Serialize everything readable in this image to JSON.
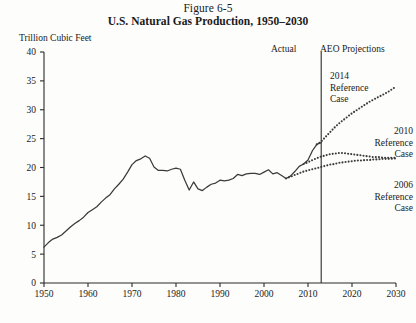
{
  "figure": {
    "number": "Figure 6-5",
    "title": "U.S. Natural Gas Production, 1950–2030",
    "unit_label": "Trillion Cubic Feet",
    "source": "Source: Energy Information Administration, Annual Energy Outlook (AEO) 2006, 2010, and 2014.",
    "period_actual_label": "Actual",
    "period_projection_label": "AEO Projections",
    "annotation_2014": "2014\nReference\nCase",
    "annotation_2014_line1": "2014",
    "annotation_2014_line2": "Reference",
    "annotation_2014_line3": "Case",
    "annotation_2010_line1": "2010",
    "annotation_2010_line2": "Reference",
    "annotation_2010_line3": "Case",
    "annotation_2006_line1": "2006",
    "annotation_2006_line2": "Reference",
    "annotation_2006_line3": "Case"
  },
  "colors": {
    "background": "#fdfdfb",
    "ink": "#1a1a1a",
    "line": "#3a3a3a",
    "axis": "#2b2b2b"
  },
  "chart_data": {
    "type": "line",
    "title": "U.S. Natural Gas Production, 1950–2030",
    "subtitle": "Figure 6-5",
    "xlabel": "",
    "ylabel": "Trillion Cubic Feet",
    "xlim": [
      1950,
      2030
    ],
    "ylim": [
      0,
      40
    ],
    "ytick_values": [
      0,
      5,
      10,
      15,
      20,
      25,
      30,
      35,
      40
    ],
    "ytick_labels": [
      "0",
      "5",
      "10",
      "15",
      "20",
      "25",
      "30",
      "35",
      "40"
    ],
    "xtick_values": [
      1950,
      1960,
      1970,
      1980,
      1990,
      2000,
      2010,
      2020,
      2030
    ],
    "xtick_labels": [
      "1950",
      "1960",
      "1970",
      "1980",
      "1990",
      "2000",
      "2010",
      "2020",
      "2030"
    ],
    "grid": false,
    "legend": "annotations-inline",
    "divider_x": 2013,
    "divider_label_left": "Actual",
    "divider_label_right": "AEO Projections",
    "series": [
      {
        "name": "Actual",
        "style": "solid",
        "x": [
          1950,
          1951,
          1952,
          1953,
          1954,
          1955,
          1956,
          1957,
          1958,
          1959,
          1960,
          1961,
          1962,
          1963,
          1964,
          1965,
          1966,
          1967,
          1968,
          1969,
          1970,
          1971,
          1972,
          1973,
          1974,
          1975,
          1976,
          1977,
          1978,
          1979,
          1980,
          1981,
          1982,
          1983,
          1984,
          1985,
          1986,
          1987,
          1988,
          1989,
          1990,
          1991,
          1992,
          1993,
          1994,
          1995,
          1996,
          1997,
          1998,
          1999,
          2000,
          2001,
          2002,
          2003,
          2004,
          2005,
          2006,
          2007,
          2008,
          2009,
          2010,
          2011,
          2012,
          2013
        ],
        "y": [
          6.2,
          7.0,
          7.6,
          7.9,
          8.3,
          9.0,
          9.7,
          10.3,
          10.8,
          11.4,
          12.2,
          12.7,
          13.2,
          14.0,
          14.7,
          15.3,
          16.3,
          17.1,
          18.0,
          19.2,
          20.5,
          21.2,
          21.5,
          22.0,
          21.6,
          20.1,
          19.5,
          19.5,
          19.4,
          19.7,
          19.9,
          19.7,
          17.8,
          16.1,
          17.5,
          16.3,
          16.0,
          16.6,
          17.1,
          17.3,
          17.8,
          17.7,
          17.8,
          18.1,
          18.8,
          18.6,
          18.9,
          19.0,
          19.0,
          18.8,
          19.2,
          19.6,
          18.9,
          19.1,
          18.6,
          18.1,
          18.5,
          19.3,
          20.2,
          20.6,
          21.3,
          22.9,
          24.0,
          24.3
        ]
      },
      {
        "name": "2006 Reference Case",
        "style": "dotted",
        "x": [
          2005,
          2006,
          2007,
          2008,
          2009,
          2010,
          2011,
          2012,
          2013,
          2014,
          2015,
          2016,
          2017,
          2018,
          2019,
          2020,
          2021,
          2022,
          2023,
          2024,
          2025,
          2026,
          2027,
          2028,
          2029,
          2030
        ],
        "y": [
          18.1,
          18.4,
          18.7,
          19.0,
          19.3,
          19.5,
          19.7,
          19.9,
          20.1,
          20.3,
          20.5,
          20.6,
          20.8,
          20.9,
          21.0,
          21.1,
          21.2,
          21.2,
          21.3,
          21.3,
          21.4,
          21.4,
          21.5,
          21.5,
          21.5,
          21.6
        ]
      },
      {
        "name": "2010 Reference Case",
        "style": "dotted",
        "x": [
          2009,
          2010,
          2011,
          2012,
          2013,
          2014,
          2015,
          2016,
          2017,
          2018,
          2019,
          2020,
          2021,
          2022,
          2023,
          2024,
          2025,
          2026,
          2027,
          2028,
          2029,
          2030
        ],
        "y": [
          20.6,
          20.9,
          21.3,
          21.6,
          21.9,
          22.1,
          22.3,
          22.4,
          22.5,
          22.5,
          22.4,
          22.3,
          22.2,
          22.1,
          22.0,
          21.9,
          21.8,
          21.8,
          21.7,
          21.7,
          21.7,
          21.7
        ]
      },
      {
        "name": "2014 Reference Case",
        "style": "dotted",
        "x": [
          2012,
          2013,
          2014,
          2015,
          2016,
          2017,
          2018,
          2019,
          2020,
          2021,
          2022,
          2023,
          2024,
          2025,
          2026,
          2027,
          2028,
          2029,
          2030
        ],
        "y": [
          24.0,
          24.5,
          25.3,
          26.1,
          26.9,
          27.6,
          28.2,
          28.8,
          29.4,
          29.9,
          30.4,
          30.9,
          31.4,
          31.8,
          32.2,
          32.6,
          33.0,
          33.5,
          34.0
        ]
      }
    ]
  }
}
